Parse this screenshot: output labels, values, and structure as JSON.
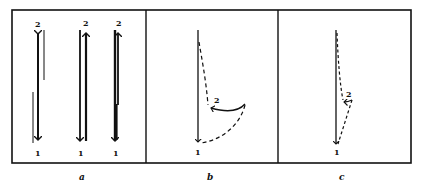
{
  "figure": {
    "panels": [
      {
        "caption": "a",
        "description": "Three vertical double-headed trajectories between points 1 and 2 with companion thin lines",
        "labels": {
          "top": "2",
          "bottom": "1"
        },
        "columns": [
          {
            "top": "2",
            "bottom": "1"
          },
          {
            "top": "2",
            "bottom": "1"
          },
          {
            "top": "2",
            "bottom": "1"
          }
        ]
      },
      {
        "caption": "b",
        "description": "Solid downward arrow to 1; dashed path descending to 2, curved solid arrow into 2, dashed curve returning to 1",
        "labels": {
          "point_2": "2",
          "point_1": "1"
        }
      },
      {
        "caption": "c",
        "description": "Solid downward arrow to 1; dashed path to 2 with short solid hook, dashed straight line returning to 1",
        "labels": {
          "point_2": "2",
          "point_1": "1"
        }
      }
    ],
    "colors": {
      "ink": "#111111",
      "background": "#ffffff"
    }
  }
}
